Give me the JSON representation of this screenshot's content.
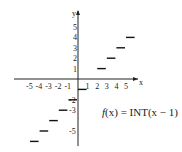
{
  "chart_data": {
    "type": "line",
    "title": "",
    "function_label": "f(x) = INT(x−1)",
    "xlabel": "x",
    "ylabel": "y",
    "x_ticks": [
      -5,
      -4,
      -3,
      -2,
      -1,
      1,
      2,
      3,
      4,
      5
    ],
    "y_ticks": [
      -5,
      -3,
      -2,
      -1,
      1,
      2,
      3,
      4,
      5
    ],
    "x_tick_labels": [
      "-5",
      "-4",
      "-3",
      "-2",
      "-1",
      "1",
      "2",
      "3",
      "4",
      "5"
    ],
    "y_tick_labels": [
      "-5",
      "-4",
      "-3",
      "-2",
      "-1",
      "1",
      "2",
      "3",
      "4",
      "5"
    ],
    "xlim": [
      -6,
      6
    ],
    "ylim": [
      -7,
      6
    ],
    "grid": false,
    "series": [
      {
        "name": "f(x) = INT(x-1)",
        "segments": [
          {
            "x": [
              -5,
              -4
            ],
            "y": -6
          },
          {
            "x": [
              -4,
              -3
            ],
            "y": -5
          },
          {
            "x": [
              -3,
              -2
            ],
            "y": -4
          },
          {
            "x": [
              -2,
              -1
            ],
            "y": -3
          },
          {
            "x": [
              -1,
              0
            ],
            "y": -2
          },
          {
            "x": [
              0,
              1
            ],
            "y": -1
          },
          {
            "x": [
              2,
              3
            ],
            "y": 1
          },
          {
            "x": [
              3,
              4
            ],
            "y": 2
          },
          {
            "x": [
              4,
              5
            ],
            "y": 3
          },
          {
            "x": [
              5,
              6
            ],
            "y": 4
          }
        ]
      }
    ]
  },
  "labels": {
    "x_axis": "x",
    "y_axis": "y",
    "fn_f": "f",
    "fn_rest": "(x) = INT(x − 1)"
  }
}
